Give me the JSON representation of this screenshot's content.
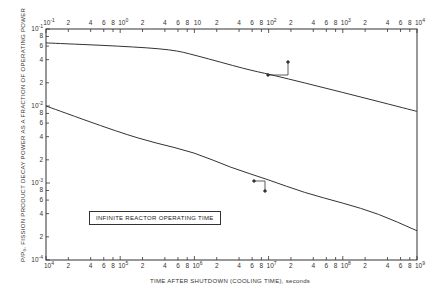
{
  "chart_data": {
    "type": "line",
    "title": "",
    "xlabel": "TIME AFTER SHUTDOWN (COOLING TIME), seconds",
    "ylabel": "P/P0, FISSION PRODUCT DECAY POWER AS A FRACTION OF OPERATING POWER",
    "x_scale": "log",
    "y_scale": "log",
    "grid": false,
    "ylim": [
      0.0001,
      0.1
    ],
    "y_ticks": [
      "10^-1",
      "8",
      "6",
      "4",
      "2",
      "10^-2",
      "8",
      "6",
      "4",
      "2",
      "10^-3",
      "8",
      "6",
      "4",
      "2",
      "10^-4"
    ],
    "x_axis_bottom": {
      "range": [
        10000,
        1000000000
      ],
      "tick_labels": [
        "10^4",
        "2",
        "4",
        "6",
        "8",
        "10^5",
        "2",
        "4",
        "6",
        "8",
        "10^6",
        "2",
        "4",
        "6",
        "8",
        "10^7",
        "2",
        "4",
        "6",
        "8",
        "10^8",
        "2",
        "4",
        "6",
        "8",
        "10^9"
      ]
    },
    "x_axis_top": {
      "range": [
        0.1,
        10000
      ],
      "tick_labels": [
        "10^-1",
        "2",
        "4",
        "6",
        "8",
        "10^0",
        "2",
        "4",
        "6",
        "8",
        "10",
        "2",
        "4",
        "6",
        "8",
        "10^2",
        "2",
        "4",
        "6",
        "8",
        "10^3",
        "2",
        "4",
        "6",
        "8",
        "10^4"
      ]
    },
    "series": [
      {
        "name": "Short cooling time (top axis, left axis)",
        "axes": "top-left",
        "x": [
          0.1,
          1,
          5,
          10,
          50,
          100,
          1000,
          10000
        ],
        "y": [
          0.066,
          0.06,
          0.054,
          0.046,
          0.03,
          0.026,
          0.015,
          0.0085
        ]
      },
      {
        "name": "Long cooling time (bottom axis, left axis)",
        "axes": "bottom-left",
        "x": [
          10000,
          100000,
          300000,
          1000000,
          3000000,
          10000000,
          30000000,
          100000000,
          300000000,
          1000000000
        ],
        "y": [
          0.01,
          0.0045,
          0.0033,
          0.0025,
          0.0016,
          0.0011,
          0.00075,
          0.00055,
          0.0004,
          0.00024
        ]
      }
    ],
    "annotations": [
      {
        "text": "INFINITE REACTOR OPERATING TIME",
        "type": "boxed-label"
      },
      {
        "type": "axis-indicator",
        "series": 0,
        "directions": [
          "left",
          "up"
        ]
      },
      {
        "type": "axis-indicator",
        "series": 1,
        "directions": [
          "left",
          "down"
        ]
      }
    ]
  },
  "labels": {
    "annotation": "INFINITE REACTOR OPERATING TIME",
    "xlabel": "TIME AFTER SHUTDOWN (COOLING TIME), seconds",
    "ylabel": "P/P₀, FISSION PRODUCT DECAY POWER AS A FRACTION OF OPERATING POWER"
  },
  "colors": {
    "line": "#333333",
    "background": "#ffffff"
  }
}
